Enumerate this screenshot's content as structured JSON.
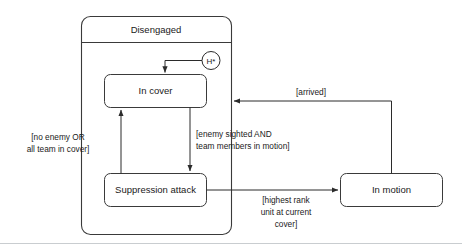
{
  "diagram": {
    "type": "uml-state-machine",
    "title_visible": false,
    "colors": {
      "stroke": "#3a3a3a",
      "connector": "#2b2b2b",
      "text": "#1a1a1a",
      "background": "#ffffff",
      "rule": "#c9cdd0"
    },
    "composite_state": {
      "name": "Disengaged",
      "label": "Disengaged"
    },
    "states": [
      {
        "id": "in-cover",
        "label": "In cover"
      },
      {
        "id": "suppression-attack",
        "label": "Suppression attack"
      },
      {
        "id": "in-motion",
        "label": "In motion"
      }
    ],
    "pseudostates": [
      {
        "id": "deep-history",
        "label": "H*",
        "kind": "deep-history"
      }
    ],
    "transitions": [
      {
        "id": "history-to-in-cover",
        "from": "deep-history",
        "to": "in-cover",
        "guard": ""
      },
      {
        "id": "in-cover-to-suppression",
        "from": "in-cover",
        "to": "suppression-attack",
        "guard_lines": [
          "[enemy sighted AND",
          "team members in motion]"
        ]
      },
      {
        "id": "suppression-to-in-cover",
        "from": "suppression-attack",
        "to": "in-cover",
        "guard_lines": [
          "[no enemy OR",
          "all team in cover]"
        ]
      },
      {
        "id": "suppression-to-in-motion",
        "from": "suppression-attack",
        "to": "in-motion",
        "guard_lines": [
          "[highest rank",
          "unit at current",
          "cover]"
        ]
      },
      {
        "id": "in-motion-to-disengaged",
        "from": "in-motion",
        "to": "Disengaged",
        "guard_lines": [
          "[arrived]"
        ]
      }
    ]
  }
}
